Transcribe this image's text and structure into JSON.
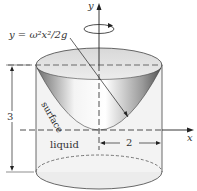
{
  "diagram": {
    "equation_label": "y = ω²x²/2g",
    "surface_label": "surface",
    "liquid_label": "liquid",
    "height_label": "3",
    "radius_label": "2",
    "y_axis_label": "y",
    "x_axis_label": "x",
    "rotation_symbol": "rotation-arrow"
  }
}
